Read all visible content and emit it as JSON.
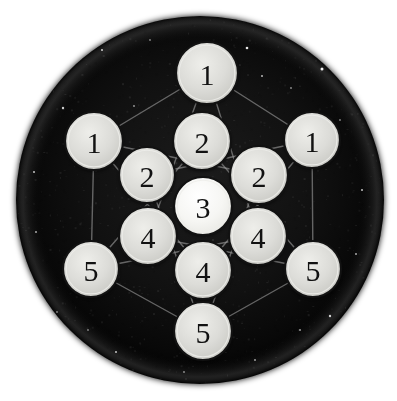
{
  "scene": {
    "title": "Numbered Disc Arrangement",
    "background_color": "#ffffff",
    "disc_field": {
      "name": "starfield-disc",
      "center_x": 200,
      "center_y": 200,
      "radius": 184,
      "fill_color": "#0b0b0b",
      "edge_glow_color": "#2e2e2e"
    },
    "linkage": {
      "name": "connection-lines",
      "stroke_color": "#9a9a9a",
      "stroke_width": 1.4,
      "description": "faint hexagram and hexagon guide lines joining the disc centers"
    },
    "token_style": {
      "face_color": "#d8d8d5",
      "center_face_color": "#f2f2ef",
      "rim_color": "#121212",
      "rim_width": 2.2,
      "highlight_color": "#ededea",
      "label_color": "#121212"
    }
  },
  "tokens": [
    {
      "id": "token-top-1",
      "label": "1",
      "cx": 207,
      "cy": 73,
      "r": 31,
      "ring": "outer",
      "variant": "normal"
    },
    {
      "id": "token-left-1",
      "label": "1",
      "cx": 94,
      "cy": 141,
      "r": 29,
      "ring": "outer",
      "variant": "normal"
    },
    {
      "id": "token-right-1",
      "label": "1",
      "cx": 312,
      "cy": 140,
      "r": 28,
      "ring": "outer",
      "variant": "normal"
    },
    {
      "id": "token-upper-2",
      "label": "2",
      "cx": 202,
      "cy": 141,
      "r": 29,
      "ring": "middle",
      "variant": "normal"
    },
    {
      "id": "token-left-2",
      "label": "2",
      "cx": 147,
      "cy": 175,
      "r": 28,
      "ring": "middle",
      "variant": "normal"
    },
    {
      "id": "token-right-2",
      "label": "2",
      "cx": 259,
      "cy": 175,
      "r": 29,
      "ring": "middle",
      "variant": "normal"
    },
    {
      "id": "token-center-3",
      "label": "3",
      "cx": 203,
      "cy": 206,
      "r": 29,
      "ring": "center",
      "variant": "bright"
    },
    {
      "id": "token-left-4",
      "label": "4",
      "cx": 148,
      "cy": 236,
      "r": 29,
      "ring": "middle",
      "variant": "normal"
    },
    {
      "id": "token-right-4",
      "label": "4",
      "cx": 258,
      "cy": 236,
      "r": 29,
      "ring": "middle",
      "variant": "normal"
    },
    {
      "id": "token-lower-4",
      "label": "4",
      "cx": 203,
      "cy": 270,
      "r": 29,
      "ring": "middle",
      "variant": "normal"
    },
    {
      "id": "token-left-5",
      "label": "5",
      "cx": 91,
      "cy": 269,
      "r": 28,
      "ring": "outer",
      "variant": "normal"
    },
    {
      "id": "token-right-5",
      "label": "5",
      "cx": 313,
      "cy": 269,
      "r": 28,
      "ring": "outer",
      "variant": "normal"
    },
    {
      "id": "token-bottom-5",
      "label": "5",
      "cx": 203,
      "cy": 331,
      "r": 29,
      "ring": "outer",
      "variant": "normal"
    }
  ],
  "links": [
    {
      "from": "token-top-1",
      "to": "token-left-1"
    },
    {
      "from": "token-top-1",
      "to": "token-right-1"
    },
    {
      "from": "token-left-1",
      "to": "token-left-5"
    },
    {
      "from": "token-right-1",
      "to": "token-right-5"
    },
    {
      "from": "token-left-5",
      "to": "token-bottom-5"
    },
    {
      "from": "token-right-5",
      "to": "token-bottom-5"
    },
    {
      "from": "token-top-1",
      "to": "token-left-4"
    },
    {
      "from": "token-top-1",
      "to": "token-right-4"
    },
    {
      "from": "token-left-1",
      "to": "token-right-2"
    },
    {
      "from": "token-left-1",
      "to": "token-lower-4"
    },
    {
      "from": "token-right-1",
      "to": "token-left-2"
    },
    {
      "from": "token-right-1",
      "to": "token-lower-4"
    },
    {
      "from": "token-left-5",
      "to": "token-upper-2"
    },
    {
      "from": "token-left-5",
      "to": "token-right-4"
    },
    {
      "from": "token-right-5",
      "to": "token-upper-2"
    },
    {
      "from": "token-right-5",
      "to": "token-left-4"
    },
    {
      "from": "token-bottom-5",
      "to": "token-left-2"
    },
    {
      "from": "token-bottom-5",
      "to": "token-right-2"
    }
  ],
  "stars": [
    {
      "x": 102,
      "y": 50,
      "r": 1.1,
      "o": 0.75
    },
    {
      "x": 134,
      "y": 106,
      "r": 0.9,
      "o": 0.6
    },
    {
      "x": 247,
      "y": 48,
      "r": 1.3,
      "o": 0.9
    },
    {
      "x": 262,
      "y": 76,
      "r": 1.0,
      "o": 0.7
    },
    {
      "x": 322,
      "y": 69,
      "r": 1.5,
      "o": 0.95
    },
    {
      "x": 291,
      "y": 88,
      "r": 0.9,
      "o": 0.55
    },
    {
      "x": 63,
      "y": 108,
      "r": 1.2,
      "o": 0.8
    },
    {
      "x": 34,
      "y": 172,
      "r": 1.1,
      "o": 0.7
    },
    {
      "x": 36,
      "y": 232,
      "r": 1.0,
      "o": 0.65
    },
    {
      "x": 57,
      "y": 312,
      "r": 0.9,
      "o": 0.5
    },
    {
      "x": 116,
      "y": 352,
      "r": 1.1,
      "o": 0.7
    },
    {
      "x": 184,
      "y": 372,
      "r": 0.9,
      "o": 0.55
    },
    {
      "x": 255,
      "y": 360,
      "r": 1.0,
      "o": 0.6
    },
    {
      "x": 330,
      "y": 316,
      "r": 1.2,
      "o": 0.8
    },
    {
      "x": 356,
      "y": 254,
      "r": 1.0,
      "o": 0.65
    },
    {
      "x": 362,
      "y": 190,
      "r": 1.1,
      "o": 0.7
    },
    {
      "x": 340,
      "y": 120,
      "r": 0.9,
      "o": 0.5
    },
    {
      "x": 150,
      "y": 40,
      "r": 0.9,
      "o": 0.5
    },
    {
      "x": 88,
      "y": 330,
      "r": 0.9,
      "o": 0.5
    },
    {
      "x": 300,
      "y": 330,
      "r": 1.0,
      "o": 0.6
    }
  ]
}
